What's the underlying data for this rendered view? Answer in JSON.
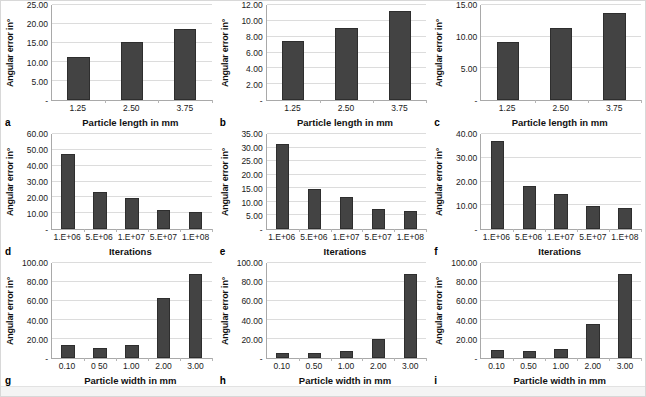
{
  "figure": {
    "panel_count": 9,
    "bar_color": "#434343",
    "bar_edge_color": "#2e2e2e",
    "gridline_color": "#dcdcdc",
    "axis_color": "#a9a9a9",
    "zero_tick_label": "-"
  },
  "chart_data": [
    {
      "type": "bar",
      "panel": "a",
      "title": "",
      "xlabel": "Particle length in mm",
      "ylabel": "Angular error in°",
      "categories": [
        "1.25",
        "2.50",
        "3.75"
      ],
      "values": [
        11.4,
        15.2,
        18.8
      ],
      "ylim": [
        0,
        25
      ],
      "yticks": [
        "-",
        "5.00",
        "10.00",
        "15.00",
        "20.00",
        "25.00"
      ],
      "ytick_values": [
        0,
        5,
        10,
        15,
        20,
        25
      ],
      "grid": true,
      "legend": "none"
    },
    {
      "type": "bar",
      "panel": "b",
      "title": "",
      "xlabel": "Particle length in mm",
      "ylabel": "Angular error in°",
      "categories": [
        "1.25",
        "2.50",
        "3.75"
      ],
      "values": [
        7.4,
        9.1,
        11.2
      ],
      "ylim": [
        0,
        12
      ],
      "yticks": [
        "-",
        "2.00",
        "4.00",
        "6.00",
        "8.00",
        "10.00",
        "12.00"
      ],
      "ytick_values": [
        0,
        2,
        4,
        6,
        8,
        10,
        12
      ],
      "grid": true,
      "legend": "none"
    },
    {
      "type": "bar",
      "panel": "c",
      "title": "",
      "xlabel": "Particle length in mm",
      "ylabel": "Angular error in°",
      "categories": [
        "1.25",
        "2.50",
        "3.75"
      ],
      "values": [
        9.2,
        11.3,
        13.8
      ],
      "ylim": [
        0,
        15
      ],
      "yticks": [
        "-",
        "5.00",
        "10.00",
        "15.00"
      ],
      "ytick_values": [
        0,
        5,
        10,
        15
      ],
      "grid": true,
      "legend": "none"
    },
    {
      "type": "bar",
      "panel": "d",
      "title": "",
      "xlabel": "Iterations",
      "ylabel": "Angular error in°",
      "categories": [
        "1.E+06",
        "5.E+06",
        "1.E+07",
        "5.E+07",
        "1.E+08"
      ],
      "values": [
        47.5,
        23.3,
        19.3,
        12.2,
        10.6
      ],
      "ylim": [
        0,
        60
      ],
      "yticks": [
        "-",
        "10.00",
        "20.00",
        "30.00",
        "40.00",
        "50.00",
        "60.00"
      ],
      "ytick_values": [
        0,
        10,
        20,
        30,
        40,
        50,
        60
      ],
      "grid": true,
      "legend": "none"
    },
    {
      "type": "bar",
      "panel": "e",
      "title": "",
      "xlabel": "Iterations",
      "ylabel": "Angular error in°",
      "categories": [
        "1.E+06",
        "5.E+06",
        "1.E+07",
        "5.E+07",
        "1.E+08"
      ],
      "values": [
        31.3,
        14.8,
        11.9,
        7.4,
        6.8
      ],
      "ylim": [
        0,
        35
      ],
      "yticks": [
        "-",
        "5.00",
        "10.00",
        "15.00",
        "20.00",
        "25.00",
        "30.00",
        "35.00"
      ],
      "ytick_values": [
        0,
        5,
        10,
        15,
        20,
        25,
        30,
        35
      ],
      "grid": true,
      "legend": "none"
    },
    {
      "type": "bar",
      "panel": "f",
      "title": "",
      "xlabel": "Iterations",
      "ylabel": "Angular error in°",
      "categories": [
        "1.E+06",
        "5.E+06",
        "1.E+07",
        "5.E+07",
        "1.E+08"
      ],
      "values": [
        37.2,
        18.0,
        14.8,
        9.5,
        8.7
      ],
      "ylim": [
        0,
        40
      ],
      "yticks": [
        "-",
        "10.00",
        "20.00",
        "30.00",
        "40.00"
      ],
      "ytick_values": [
        0,
        10,
        20,
        30,
        40
      ],
      "grid": true,
      "legend": "none"
    },
    {
      "type": "bar",
      "panel": "g",
      "title": "",
      "xlabel": "Particle width in mm",
      "ylabel": "Angular error in°",
      "categories": [
        "0.10",
        "0 50",
        "1.00",
        "2.00",
        "3.00"
      ],
      "values": [
        13.5,
        10.5,
        14.0,
        63.0,
        88.5
      ],
      "ylim": [
        0,
        100
      ],
      "yticks": [
        "-",
        "20.00",
        "40.00",
        "60.00",
        "80.00",
        "100.00"
      ],
      "ytick_values": [
        0,
        20,
        40,
        60,
        80,
        100
      ],
      "grid": true,
      "legend": "none"
    },
    {
      "type": "bar",
      "panel": "h",
      "title": "",
      "xlabel": "Particle width in mm",
      "ylabel": "Angular error in°",
      "categories": [
        "0.10",
        "0.50",
        "1.00",
        "2.00",
        "3.00"
      ],
      "values": [
        5.8,
        5.8,
        7.5,
        19.5,
        88.0
      ],
      "ylim": [
        0,
        100
      ],
      "yticks": [
        "-",
        "20.00",
        "40.00",
        "60.00",
        "80.00",
        "100.00"
      ],
      "ytick_values": [
        0,
        20,
        40,
        60,
        80,
        100
      ],
      "grid": true,
      "legend": "none"
    },
    {
      "type": "bar",
      "panel": "i",
      "title": "",
      "xlabel": "Particle width in mm",
      "ylabel": "Angular error in°",
      "categories": [
        "0.10",
        "0.50",
        "1.00",
        "2.00",
        "3.00"
      ],
      "values": [
        8.5,
        7.5,
        9.5,
        35.5,
        88.0
      ],
      "ylim": [
        0,
        100
      ],
      "yticks": [
        "-",
        "20.00",
        "40.00",
        "60.00",
        "80.00",
        "100.00"
      ],
      "ytick_values": [
        0,
        20,
        40,
        60,
        80,
        100
      ],
      "grid": true,
      "legend": "none"
    }
  ]
}
